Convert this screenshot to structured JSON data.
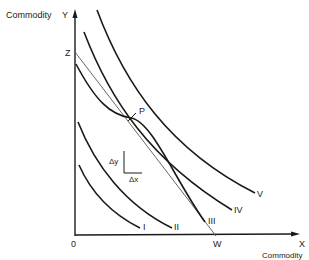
{
  "diagram": {
    "axes": {
      "y_axis_label": "Commodity",
      "y_axis_letter": "Y",
      "x_axis_label": "Commodity",
      "x_axis_letter": "X",
      "origin_label": "0"
    },
    "budget_line": {
      "start_label": "Z",
      "end_label": "W"
    },
    "tangency_point": {
      "label": "P"
    },
    "slope_triangle": {
      "dy_label": "Δy",
      "dx_label": "Δx"
    },
    "curves": [
      {
        "label": "I"
      },
      {
        "label": "II"
      },
      {
        "label": "III"
      },
      {
        "label": "IV"
      },
      {
        "label": "V"
      }
    ],
    "colors": {
      "line": "#1a1a1a",
      "budget_line": "#555555",
      "background": "#ffffff"
    }
  }
}
